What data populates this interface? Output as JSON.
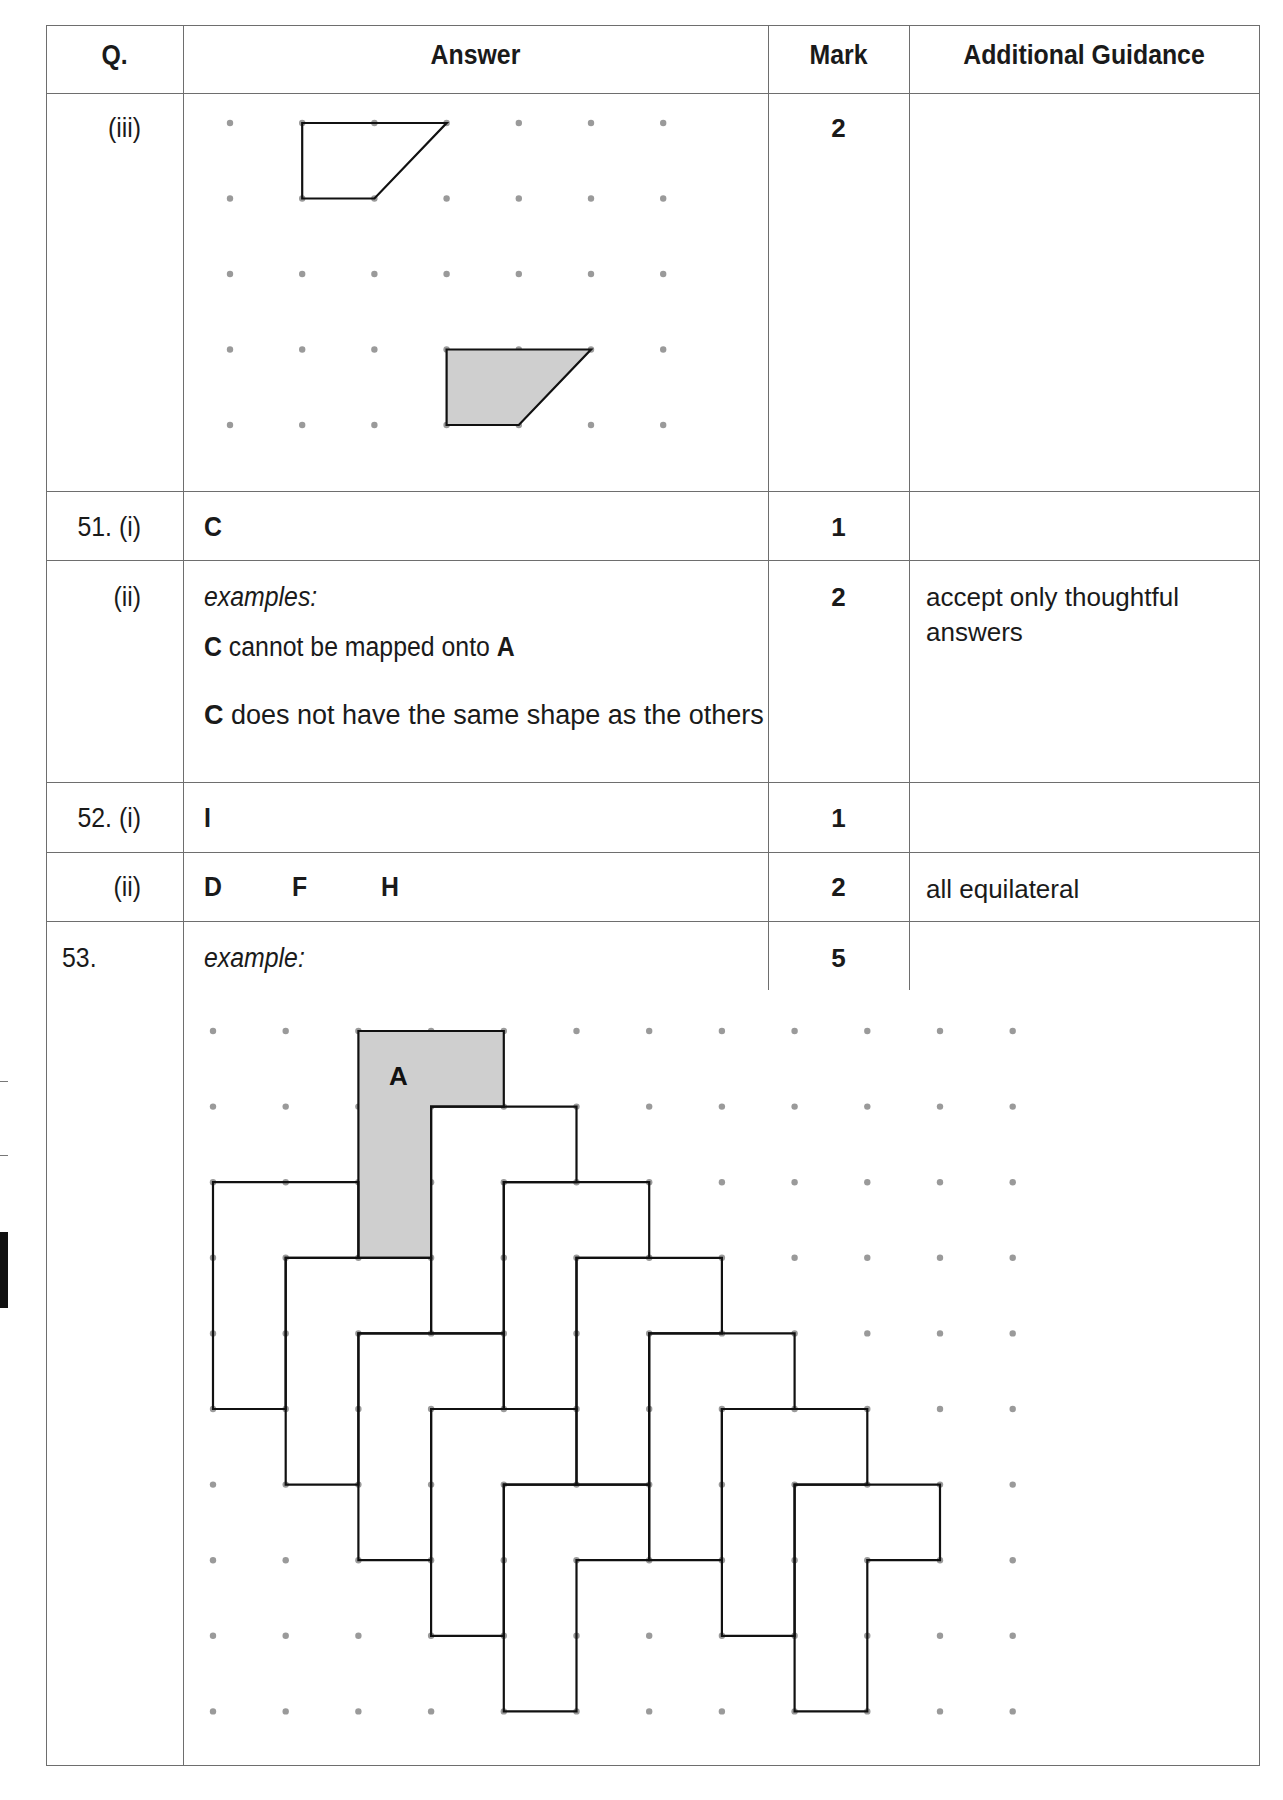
{
  "table": {
    "headers": {
      "q": "Q.",
      "answer": "Answer",
      "mark": "Mark",
      "guidance": "Additional Guidance"
    },
    "rows": [
      {
        "q": "(iii)",
        "answer_type": "diagram",
        "mark": "2",
        "guidance": ""
      },
      {
        "q": "51. (i)",
        "answer": "C",
        "mark": "1",
        "guidance": ""
      },
      {
        "q": "(ii)",
        "answer_intro": "examples:",
        "answer_lines": [
          {
            "bold1": "C",
            "text": " cannot be mapped onto ",
            "bold2": "A"
          },
          {
            "bold1": "C",
            "text": " does not have the same shape as the others",
            "bold2": ""
          }
        ],
        "mark": "2",
        "guidance": "accept only thoughtful answers"
      },
      {
        "q": "52. (i)",
        "answer": "I",
        "mark": "1",
        "guidance": ""
      },
      {
        "q": "(ii)",
        "answer_letters": [
          "D",
          "F",
          "H"
        ],
        "mark": "2",
        "guidance": "all equilateral"
      },
      {
        "q": "53.",
        "answer_intro": "example:",
        "mark": "5",
        "guidance": ""
      }
    ]
  },
  "diagram_iii": {
    "grid": {
      "cols": 7,
      "rows": 5
    },
    "outline_shape": [
      [
        1,
        0
      ],
      [
        3,
        0
      ],
      [
        2,
        1
      ],
      [
        1,
        1
      ]
    ],
    "shaded_shape": [
      [
        3,
        3
      ],
      [
        5,
        3
      ],
      [
        4,
        4
      ],
      [
        3,
        4
      ]
    ],
    "shade_color": "#cfcfcf"
  },
  "diagram_53": {
    "grid": {
      "cols": 12,
      "rows": 10
    },
    "shape_offsets": [
      [
        0,
        0
      ],
      [
        2,
        0
      ]
    ],
    "tile_template": [
      [
        0,
        0
      ],
      [
        2,
        0
      ],
      [
        2,
        1
      ],
      [
        1,
        1
      ],
      [
        1,
        3
      ],
      [
        0,
        3
      ]
    ],
    "shaded_tile": [
      2,
      0
    ],
    "shaded_label": "A",
    "tiles": [
      [
        2,
        0
      ],
      [
        3,
        1
      ],
      [
        4,
        2
      ],
      [
        5,
        3
      ],
      [
        0,
        2
      ],
      [
        1,
        3
      ],
      [
        2,
        4
      ],
      [
        3,
        5
      ],
      [
        4,
        6
      ],
      [
        6,
        4
      ],
      [
        7,
        5
      ],
      [
        8,
        6
      ]
    ],
    "shade_color": "#cfcfcf"
  }
}
